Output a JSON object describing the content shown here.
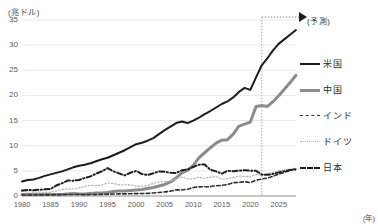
{
  "chart_data": {
    "type": "line",
    "title": "",
    "xlabel": "(年)",
    "ylabel": "(兆ドル)",
    "unit_label": "(兆ドル)",
    "xaxis_unit": "(年)",
    "xlim": [
      1980,
      2028
    ],
    "ylim": [
      0,
      35
    ],
    "yticks": [
      0,
      5,
      10,
      15,
      20,
      25,
      30,
      35
    ],
    "xticks": [
      1980,
      1985,
      1990,
      1995,
      2000,
      2005,
      2010,
      2015,
      2020,
      2025
    ],
    "grid": true,
    "legend_position": "right",
    "annotations": [
      {
        "name": "forecast-divider",
        "text": "(予測)",
        "x": 2022,
        "style": "dotted-vertical-line-with-arrow"
      }
    ],
    "x": [
      1980,
      1981,
      1982,
      1983,
      1984,
      1985,
      1986,
      1987,
      1988,
      1989,
      1990,
      1991,
      1992,
      1993,
      1994,
      1995,
      1996,
      1997,
      1998,
      1999,
      2000,
      2001,
      2002,
      2003,
      2004,
      2005,
      2006,
      2007,
      2008,
      2009,
      2010,
      2011,
      2012,
      2013,
      2014,
      2015,
      2016,
      2017,
      2018,
      2019,
      2020,
      2021,
      2022,
      2023,
      2024,
      2025,
      2026,
      2027,
      2028
    ],
    "series": [
      {
        "name": "米国",
        "key": "usa",
        "color": "#1c1c1c",
        "style": "solid",
        "width": 2,
        "values": [
          2.9,
          3.2,
          3.3,
          3.6,
          4.0,
          4.3,
          4.6,
          4.9,
          5.3,
          5.7,
          6.0,
          6.2,
          6.5,
          6.9,
          7.3,
          7.6,
          8.1,
          8.6,
          9.1,
          9.7,
          10.3,
          10.6,
          11.0,
          11.5,
          12.3,
          13.1,
          13.8,
          14.5,
          14.8,
          14.5,
          15.0,
          15.6,
          16.3,
          16.9,
          17.6,
          18.3,
          18.8,
          19.6,
          20.7,
          21.5,
          21.1,
          23.6,
          26.0,
          27.4,
          29.0,
          30.3,
          31.2,
          32.1,
          33.0
        ]
      },
      {
        "name": "中国",
        "key": "china",
        "color": "#8c8c8c",
        "style": "solid",
        "width": 3,
        "values": [
          0.3,
          0.3,
          0.3,
          0.3,
          0.3,
          0.3,
          0.3,
          0.3,
          0.4,
          0.5,
          0.4,
          0.4,
          0.5,
          0.6,
          0.6,
          0.7,
          0.9,
          1.0,
          1.0,
          1.1,
          1.2,
          1.3,
          1.5,
          1.7,
          2.0,
          2.3,
          2.8,
          3.6,
          4.6,
          5.1,
          6.1,
          7.6,
          8.6,
          9.6,
          10.5,
          11.1,
          11.2,
          12.3,
          13.9,
          14.3,
          14.7,
          17.8,
          18.0,
          17.8,
          18.8,
          20.0,
          21.3,
          22.6,
          24.0
        ]
      },
      {
        "name": "インド",
        "key": "india",
        "color": "#2e2e2e",
        "style": "dashed",
        "width": 1.6,
        "values": [
          0.19,
          0.2,
          0.2,
          0.22,
          0.21,
          0.24,
          0.25,
          0.28,
          0.3,
          0.3,
          0.32,
          0.27,
          0.29,
          0.28,
          0.33,
          0.36,
          0.4,
          0.42,
          0.42,
          0.46,
          0.47,
          0.49,
          0.52,
          0.61,
          0.71,
          0.82,
          0.94,
          1.22,
          1.2,
          1.34,
          1.68,
          1.82,
          1.83,
          1.86,
          2.04,
          2.1,
          2.29,
          2.65,
          2.7,
          2.84,
          2.67,
          3.15,
          3.39,
          3.57,
          3.94,
          4.34,
          4.7,
          5.1,
          5.5
        ]
      },
      {
        "name": "ドイツ",
        "key": "germany",
        "color": "#b4b4b4",
        "style": "dotted",
        "width": 1.2,
        "values": [
          0.95,
          0.8,
          0.78,
          0.77,
          0.73,
          0.73,
          1.0,
          1.28,
          1.4,
          1.4,
          1.6,
          1.87,
          2.13,
          2.07,
          2.21,
          2.59,
          2.5,
          2.22,
          2.24,
          2.2,
          1.95,
          1.95,
          2.08,
          2.5,
          2.81,
          2.85,
          3.0,
          3.44,
          3.75,
          3.42,
          3.4,
          3.75,
          3.53,
          3.73,
          3.89,
          3.36,
          3.47,
          3.69,
          3.97,
          3.89,
          3.89,
          4.28,
          4.08,
          4.46,
          4.7,
          5.0,
          5.2,
          5.35,
          5.5
        ]
      },
      {
        "name": "日本",
        "key": "japan",
        "color": "#1c1c1c",
        "style": "dashdot",
        "width": 2,
        "values": [
          1.1,
          1.22,
          1.13,
          1.24,
          1.32,
          1.4,
          2.08,
          2.53,
          3.07,
          3.05,
          3.19,
          3.58,
          3.91,
          4.45,
          4.91,
          5.55,
          4.92,
          4.49,
          4.1,
          4.63,
          4.97,
          4.37,
          4.18,
          4.52,
          4.89,
          4.83,
          4.6,
          4.58,
          5.11,
          5.29,
          5.76,
          6.23,
          6.27,
          5.21,
          4.9,
          4.44,
          5.0,
          4.93,
          5.04,
          5.12,
          5.04,
          5.01,
          4.26,
          4.21,
          4.4,
          4.7,
          4.95,
          5.15,
          5.3
        ]
      }
    ]
  },
  "legend": {
    "items": [
      {
        "label": "米国",
        "key": "usa"
      },
      {
        "label": "中国",
        "key": "china"
      },
      {
        "label": "インド",
        "key": "india"
      },
      {
        "label": "ドイツ",
        "key": "germany"
      },
      {
        "label": "日本",
        "key": "japan"
      }
    ]
  }
}
